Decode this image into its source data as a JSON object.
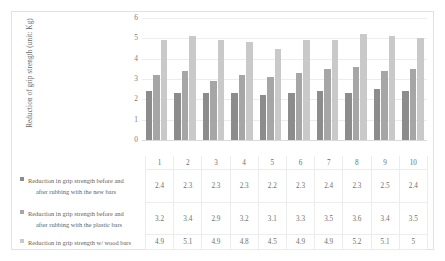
{
  "chart_data": {
    "type": "bar",
    "title": "",
    "xlabel": "",
    "ylabel": "Reduction of grip strength (unit: Kg)",
    "categories": [
      "1",
      "2",
      "3",
      "4",
      "5",
      "6",
      "7",
      "8",
      "9",
      "10"
    ],
    "ylim": [
      0,
      6
    ],
    "ytick_labels": [
      "6",
      "5",
      "4",
      "3",
      "2",
      "1",
      "0"
    ],
    "ytick_values": [
      6,
      5,
      4,
      3,
      2,
      1,
      0
    ],
    "grid": true,
    "legend_position": "bottom-left-table",
    "has_data_table": true,
    "series": [
      {
        "name": "Reduction in grip strength before and after rubbing with the new bars",
        "name_line1": "Reduction in grip strength before and",
        "name_line2": "after rubbing with the new bars",
        "color": "#8c8c8c",
        "values": [
          2.4,
          2.3,
          2.3,
          2.3,
          2.2,
          2.3,
          2.4,
          2.3,
          2.5,
          2.4
        ],
        "value_labels": [
          "2.4",
          "2.3",
          "2.3",
          "2.3",
          "2.2",
          "2.3",
          "2.4",
          "2.3",
          "2.5",
          "2.4"
        ]
      },
      {
        "name": "Reduction in grip strength before and after rubbing with the plastic bars",
        "name_line1": "Reduction in grip strength before and",
        "name_line2": "after rubbing with the plastic bars",
        "color": "#a6a6a6",
        "values": [
          3.2,
          3.4,
          2.9,
          3.2,
          3.1,
          3.3,
          3.5,
          3.6,
          3.4,
          3.5
        ],
        "value_labels": [
          "3.2",
          "3.4",
          "2.9",
          "3.2",
          "3.1",
          "3.3",
          "3.5",
          "3.6",
          "3.4",
          "3.5"
        ]
      },
      {
        "name": "Reduction in grip strength w/ wood bars",
        "name_line1": "Reduction in grip strength w/ wood bars",
        "name_line2": "",
        "color": "#c9c9c9",
        "values": [
          4.9,
          5.1,
          4.9,
          4.8,
          4.5,
          4.9,
          4.9,
          5.2,
          5.1,
          5.0
        ],
        "value_labels": [
          "4.9",
          "5.1",
          "4.9",
          "4.8",
          "4.5",
          "4.9",
          "4.9",
          "5.2",
          "5.1",
          "5"
        ]
      }
    ]
  }
}
